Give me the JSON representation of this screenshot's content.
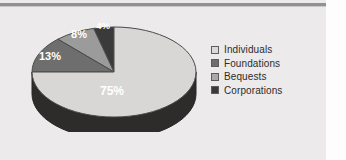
{
  "chart_data": {
    "type": "pie",
    "title": "",
    "categories": [
      "Individuals",
      "Foundations",
      "Bequests",
      "Corporations"
    ],
    "values": [
      75,
      13,
      8,
      4
    ],
    "labels": [
      "75%",
      "13%",
      "8%",
      "4%"
    ],
    "colors": [
      "#d9d7d5",
      "#6e6e6e",
      "#9b9b9b",
      "#3a3a3a"
    ],
    "units": "percent",
    "legend_position": "right",
    "three_d": true,
    "grid": false
  },
  "canvas": {
    "background": "#eceaea",
    "margin_background": "#fdfdfd",
    "rule_color": "#8f9193"
  },
  "pie": {
    "side_color": "#2e2c2b",
    "outline_color": "#4a4a4a",
    "label_color": "#ffffff",
    "slices": [
      {
        "name": "Individuals",
        "label": "75%",
        "value": 75,
        "color": "#d9d7d5",
        "label_x": 112,
        "label_y": 78
      },
      {
        "name": "Foundations",
        "label": "13%",
        "value": 13,
        "color": "#6e6e6e",
        "label_x": 50,
        "label_y": 43
      },
      {
        "name": "Bequests",
        "label": "8%",
        "value": 8,
        "color": "#9b9b9b",
        "label_x": 79,
        "label_y": 21
      },
      {
        "name": "Corporations",
        "label": "4%",
        "value": 4,
        "color": "#3a3a3a",
        "label_x": 103,
        "label_y": 12
      }
    ]
  },
  "legend": {
    "items": [
      {
        "label": "Individuals",
        "color": "#dcdad8"
      },
      {
        "label": "Foundations",
        "color": "#6e6e6e"
      },
      {
        "label": "Bequests",
        "color": "#a9a9a9"
      },
      {
        "label": "Corporations",
        "color": "#3a3a3a"
      }
    ]
  }
}
